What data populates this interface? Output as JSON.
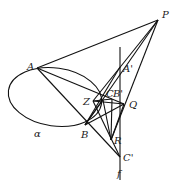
{
  "diagram": {
    "type": "projective-geometry",
    "points": {
      "P": [
        158,
        20
      ],
      "A": [
        37,
        68
      ],
      "A_prime": [
        120,
        67
      ],
      "Z": [
        93,
        101
      ],
      "C": [
        103,
        100
      ],
      "B_prime": [
        112,
        99
      ],
      "Q": [
        124,
        104
      ],
      "B": [
        85,
        125
      ],
      "R": [
        111,
        140
      ],
      "C_prime": [
        120,
        157
      ]
    },
    "labels": {
      "P": "P",
      "A": "A",
      "A_prime": "A'",
      "Z": "Z",
      "C": "C",
      "B_prime": "B'",
      "Q": "Q",
      "B": "B",
      "R": "R",
      "C_prime": "C'",
      "alpha": "α",
      "f": "f"
    },
    "curve": {
      "name": "α",
      "type": "ellipse",
      "cx": 55,
      "cy": 97,
      "rx": 47,
      "ry": 29,
      "rotate": 8
    },
    "line_f": {
      "x": 120,
      "y1": 47,
      "y2": 180
    },
    "stroke_color": "#111111"
  }
}
